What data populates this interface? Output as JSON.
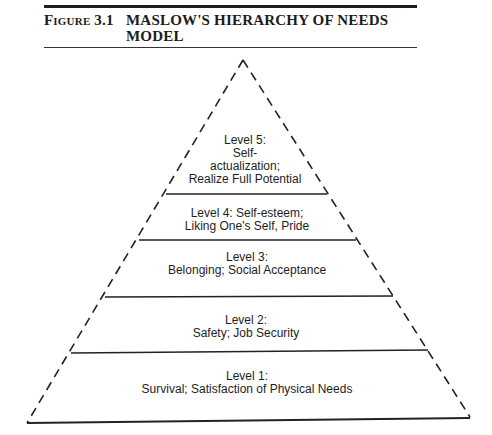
{
  "figure": {
    "number": "Figure 3.1",
    "title": "MASLOW'S HIERARCHY OF NEEDS MODEL"
  },
  "diagram": {
    "type": "pyramid",
    "levels": [
      {
        "id": 5,
        "lines": [
          "Level 5:",
          "Self-",
          "actualization;",
          "Realize Full Potential"
        ]
      },
      {
        "id": 4,
        "lines": [
          "Level 4: Self-esteem;",
          "Liking One's Self, Pride"
        ]
      },
      {
        "id": 3,
        "lines": [
          "Level 3:",
          "Belonging; Social Acceptance"
        ]
      },
      {
        "id": 2,
        "lines": [
          "Level 2:",
          "Safety; Job Security"
        ]
      },
      {
        "id": 1,
        "lines": [
          "Level 1:",
          "Survival; Satisfaction of Physical Needs"
        ]
      }
    ],
    "colors": {
      "line": "#222222",
      "background": "#ffffff"
    }
  }
}
